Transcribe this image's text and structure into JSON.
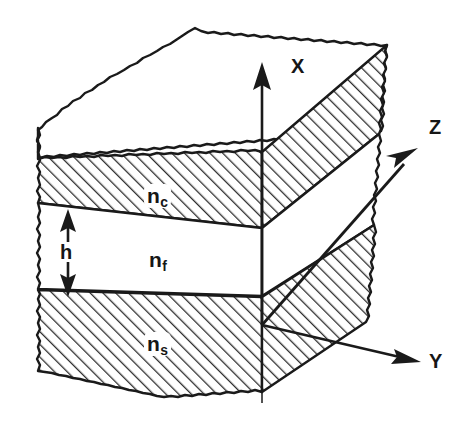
{
  "figure": {
    "kind": "slab-waveguide-cross-section",
    "background_color": "#ffffff",
    "ink_color": "#161616"
  },
  "axes": {
    "x": {
      "label": "X",
      "direction": "up",
      "icon": "arrow-up-icon"
    },
    "y": {
      "label": "Y",
      "direction": "right",
      "icon": "arrow-right-icon"
    },
    "z": {
      "label": "Z",
      "direction": "up-right",
      "icon": "arrow-up-right-icon"
    },
    "origin_label": ""
  },
  "layers": [
    {
      "id": "cover",
      "label": "n",
      "subscript": "c",
      "fill": "hatched",
      "hatch_color": "#303030"
    },
    {
      "id": "film",
      "label": "n",
      "subscript": "f",
      "fill": "white",
      "hatch_color": ""
    },
    {
      "id": "substrate",
      "label": "n",
      "subscript": "s",
      "fill": "hatched",
      "hatch_color": "#303030"
    }
  ],
  "dimension": {
    "label": "h",
    "icon": "double-arrow-vertical-icon",
    "measures": "film-layer-thickness"
  }
}
